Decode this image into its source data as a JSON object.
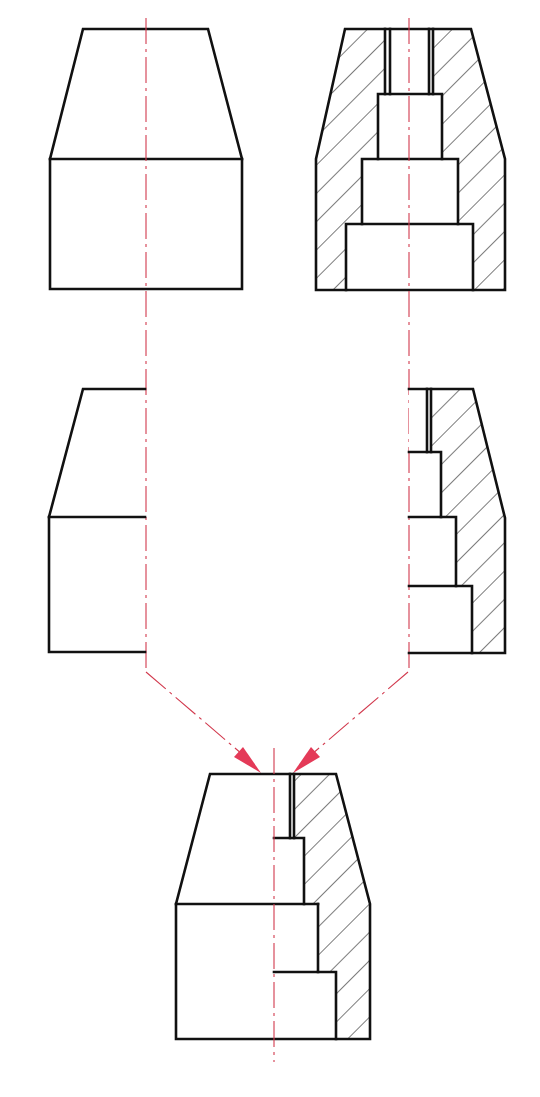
{
  "diagram": {
    "type": "technical-drawing",
    "colors": {
      "outline": "#111111",
      "centerline": "#d23a4e",
      "arrow": "#e43a58",
      "background": "#ffffff"
    },
    "views": [
      {
        "id": "full-view",
        "label": "Full exterior view (top-left)"
      },
      {
        "id": "full-section",
        "label": "Full section view with hatching (top-right)"
      },
      {
        "id": "left-half-view",
        "label": "Left half of exterior view (middle-left)"
      },
      {
        "id": "right-half-section",
        "label": "Right half of section view (middle-right)"
      },
      {
        "id": "half-section-result",
        "label": "Combined half-section view (bottom)"
      }
    ],
    "arrows": [
      {
        "from": "left-half-view",
        "to": "half-section-result"
      },
      {
        "from": "right-half-section",
        "to": "half-section-result"
      }
    ]
  }
}
